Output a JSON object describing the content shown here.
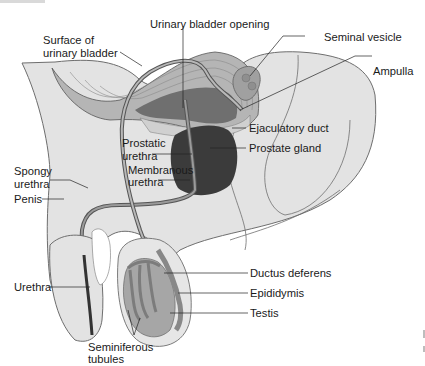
{
  "diagram": {
    "colors": {
      "body": "#e3e3e3",
      "body_outline": "#6e6e6e",
      "bladder_wall": "#a9a9a9",
      "bladder_dark": "#6f6f6f",
      "prostate": "#3b3b3b",
      "duct": "#9a9a9a",
      "duct_outline": "#555555",
      "testis": "#a6a6a6",
      "tubules": "#8a8a8a",
      "leader_line": "#222222",
      "label_text": "#1a1a1a"
    },
    "labels": {
      "surface_of_bladder": [
        "Surface of",
        "urinary bladder"
      ],
      "bladder_opening": "Urinary bladder opening",
      "seminal_vesicle": "Seminal vesicle",
      "ampulla": "Ampulla",
      "ejaculatory_duct": "Ejaculatory duct",
      "prostate_gland": "Prostate gland",
      "prostatic_urethra": [
        "Prostatic",
        "urethra"
      ],
      "spongy_urethra": [
        "Spongy",
        "urethra"
      ],
      "membranous_urethra": [
        "Membranous",
        "urethra"
      ],
      "penis": "Penis",
      "ductus_deferens": "Ductus deferens",
      "epididymis": "Epididymis",
      "urethra": "Urethra",
      "testis": "Testis",
      "seminiferous_tubules": [
        "Seminiferous",
        "tubules"
      ]
    }
  }
}
